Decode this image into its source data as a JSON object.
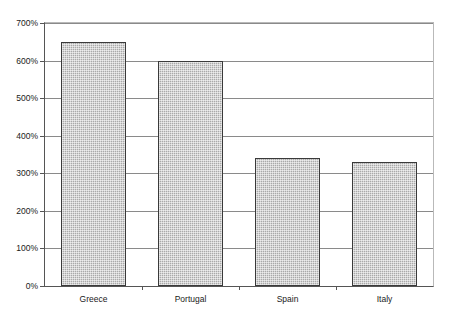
{
  "chart_data": {
    "type": "bar",
    "title": "",
    "subtitle": "",
    "xlabel": "",
    "ylabel": "",
    "categories": [
      "Greece",
      "Portugal",
      "Spain",
      "Italy"
    ],
    "values": [
      650,
      600,
      340,
      330
    ],
    "value_labels": [
      "650%",
      "600%",
      "340%",
      "330%"
    ],
    "ylim": [
      0,
      700
    ],
    "ytick_values": [
      0,
      100,
      200,
      300,
      400,
      500,
      600,
      700
    ],
    "ytick_labels": [
      "0%",
      "100%",
      "200%",
      "300%",
      "400%",
      "500%",
      "600%",
      "700%"
    ],
    "grid": true,
    "grid_axis": "y",
    "legend": false,
    "legend_position": "none",
    "series": [
      {
        "name": "",
        "values": [
          650,
          600,
          340,
          330
        ]
      }
    ],
    "colors": {
      "bar_fill": "#a9a9a9",
      "bar_border": "#3a3a3a",
      "gridline": "#8a8a8a",
      "axis": "#555555",
      "plot_border": "#b9b9b9",
      "background": "#ffffff",
      "text": "#1a1a1a"
    }
  }
}
